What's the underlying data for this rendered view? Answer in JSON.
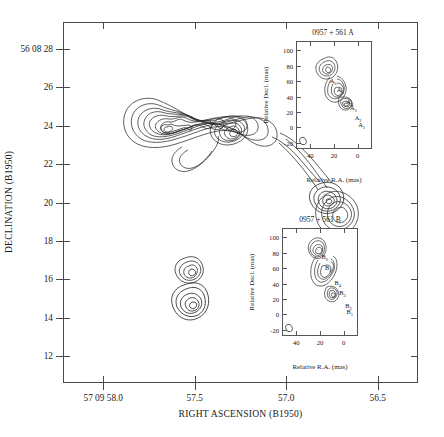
{
  "figure": {
    "kind": "radio-contour-map",
    "object": "0957 + 561"
  },
  "main_axes": {
    "x_title": "RIGHT ASCENSION (B1950)",
    "y_title": "DECLINATION (B1950)",
    "x_ticks": [
      {
        "value": 58.0,
        "label": "57 09 58.0"
      },
      {
        "value": 57.5,
        "label": "57.5"
      },
      {
        "value": 57.0,
        "label": "57.0"
      },
      {
        "value": 56.5,
        "label": "56.5"
      }
    ],
    "y_ticks": [
      {
        "value": 28,
        "label": "56 08 28"
      },
      {
        "value": 26,
        "label": "26"
      },
      {
        "value": 24,
        "label": "24"
      },
      {
        "value": 22,
        "label": "22"
      },
      {
        "value": 20,
        "label": "20"
      },
      {
        "value": 18,
        "label": "18"
      },
      {
        "value": 16,
        "label": "16"
      },
      {
        "value": 14,
        "label": "14"
      },
      {
        "value": 12,
        "label": "12"
      }
    ],
    "x_range": [
      58.22,
      56.28
    ],
    "y_range": [
      10.6,
      29.4
    ]
  },
  "inset_a": {
    "title": "0957 + 561 A",
    "x_title": "Relative R.A. (mas)",
    "y_title": "Relative Decl. (mas)",
    "x_ticks": [
      "40",
      "20",
      "0"
    ],
    "y_ticks": [
      "100",
      "80",
      "60",
      "40",
      "20",
      "0",
      "-20"
    ],
    "components": [
      {
        "label": "A",
        "sub": "6",
        "x": 27,
        "y": 58
      },
      {
        "label": "A",
        "sub": "5",
        "x": 21,
        "y": 46
      },
      {
        "label": "A",
        "sub": "4",
        "x": 13,
        "y": 30
      },
      {
        "label": "A",
        "sub": "3",
        "x": 10,
        "y": 22
      },
      {
        "label": "A",
        "sub": "2",
        "x": 6,
        "y": 10
      },
      {
        "label": "A",
        "sub": "1",
        "x": 3,
        "y": 1
      }
    ]
  },
  "inset_b": {
    "title": "0957 + 561 B",
    "x_title": "Relative R.A. (mas)",
    "y_title": "Relative Decl. (mas)",
    "x_ticks": [
      "40",
      "20",
      "0"
    ],
    "y_ticks": [
      "100",
      "80",
      "60",
      "40",
      "20",
      "0",
      "-20"
    ],
    "components": [
      {
        "label": "B",
        "sub": "6",
        "x": 23,
        "y": 72
      },
      {
        "label": "B",
        "sub": "5",
        "x": 20,
        "y": 58
      },
      {
        "label": "B",
        "sub": "4",
        "x": 12,
        "y": 38
      },
      {
        "label": "B",
        "sub": "3",
        "x": 8,
        "y": 25
      },
      {
        "label": "B",
        "sub": "2",
        "x": 3,
        "y": 8
      },
      {
        "label": "B",
        "sub": "1",
        "x": 2,
        "y": 0
      }
    ]
  },
  "chart_data": {
    "type": "contour",
    "title": "",
    "xlabel": "RIGHT ASCENSION (B1950)",
    "ylabel": "DECLINATION (B1950)",
    "xlim": [
      58.22,
      56.28
    ],
    "ylim": [
      10.6,
      29.4
    ],
    "grid": false,
    "legend": "none",
    "features": [
      {
        "name": "northern-extended-lobe",
        "ra": 57.72,
        "dec": 24.7,
        "n_contours": 9,
        "note": "bright resolved lobe with inner peak"
      },
      {
        "name": "central-knot",
        "ra": 57.52,
        "dec": 24.5,
        "n_contours": 5
      },
      {
        "name": "bridge-filament",
        "ra": 57.4,
        "dec": 24.0,
        "n_contours": 2
      },
      {
        "name": "compact-source-north",
        "ra": 57.31,
        "dec": 22.4,
        "n_contours": 5
      },
      {
        "name": "compact-image-A",
        "ra": 57.44,
        "dec": 16.8,
        "n_contours": 4
      },
      {
        "name": "compact-image-B",
        "ra": 57.44,
        "dec": 16.1,
        "n_contours": 5
      },
      {
        "name": "southern-extended-lobe",
        "ra": 56.95,
        "dec": 19.9,
        "n_contours": 4
      }
    ]
  }
}
